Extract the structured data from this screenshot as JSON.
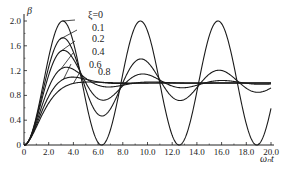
{
  "chart_data": {
    "type": "line",
    "title": "",
    "xlabel": "ω_n t",
    "ylabel": "β",
    "xlim": [
      0,
      20
    ],
    "ylim": [
      0,
      2.1
    ],
    "x_ticks": [
      "0",
      "2.0",
      "4.0",
      "6.0",
      "8.0",
      "10.0",
      "12.0",
      "14.0",
      "16.0",
      "18.0",
      "20.0"
    ],
    "x_tick_values": [
      0,
      2,
      4,
      6,
      8,
      10,
      12,
      14,
      16,
      18,
      20
    ],
    "y_ticks": [
      "0",
      "0.4",
      "0.8",
      "1.2",
      "1.6",
      "2.0"
    ],
    "y_tick_values": [
      0,
      0.4,
      0.8,
      1.2,
      1.6,
      2.0
    ],
    "function": "beta = 1 - exp(-xi*t)*(cos(wd*t) + xi/sqrt(1-xi^2)*sin(wd*t)), wd = sqrt(1-xi^2)",
    "series": [
      {
        "name": "ξ=0",
        "xi": 0.0,
        "label": "ξ=0"
      },
      {
        "name": "0.1",
        "xi": 0.1,
        "label": "0.1"
      },
      {
        "name": "0.2",
        "xi": 0.2,
        "label": "0.2"
      },
      {
        "name": "0.4",
        "xi": 0.4,
        "label": "0.4"
      },
      {
        "name": "0.6",
        "xi": 0.6,
        "label": "0.6"
      },
      {
        "name": "0.8",
        "xi": 0.8,
        "label": "0.8"
      }
    ],
    "grid": false,
    "legend": "inline-annotations"
  },
  "axis": {
    "origin_label": "0",
    "x_title": "ωₙt",
    "y_title": "β"
  }
}
